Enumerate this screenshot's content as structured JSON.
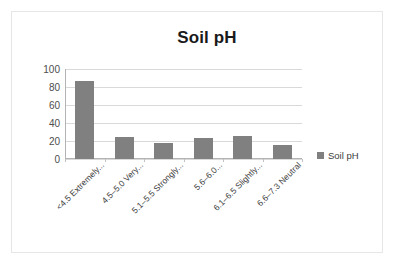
{
  "chart_data": {
    "type": "bar",
    "title": "Soil pH",
    "xlabel": "",
    "ylabel": "",
    "ylim": [
      0,
      100
    ],
    "yticks": [
      100,
      80,
      60,
      40,
      20,
      0
    ],
    "grid": true,
    "legend_position": "right",
    "series_name": "Soil pH",
    "bar_color": "#808080",
    "categories": [
      "<4.5 Extremely...",
      "4.5–5.0 Very...",
      "5.1–5.5 Strongly...",
      "5.6–6.0...",
      "6.1–6.5 Slightly...",
      "6.6–7.3 Neutral"
    ],
    "values": [
      87,
      25,
      18,
      23,
      26,
      16
    ],
    "series": [
      {
        "name": "Soil pH",
        "values": [
          87,
          25,
          18,
          23,
          26,
          16
        ]
      }
    ]
  },
  "legend": {
    "entries": [
      {
        "label": "Soil pH",
        "color": "#808080"
      }
    ]
  }
}
